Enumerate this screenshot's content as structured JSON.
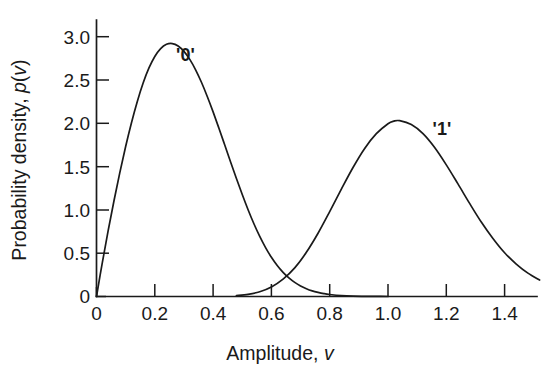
{
  "chart_data": {
    "type": "line",
    "title": "",
    "xlabel": "Amplitude, v",
    "xlabel_prefix": "Amplitude, ",
    "xlabel_symbol": "v",
    "ylabel": "Probability density, p(v)",
    "ylabel_prefix": "Probability density, ",
    "ylabel_symbol": "p",
    "ylabel_arg_open": "(",
    "ylabel_arg": "v",
    "ylabel_arg_close": ")",
    "xlim": [
      0,
      1.52
    ],
    "ylim": [
      0,
      3.25
    ],
    "grid": false,
    "legend_position": "inline-annotations",
    "xticks": [
      0,
      0.2,
      0.4,
      0.6,
      0.8,
      1.0,
      1.2,
      1.4
    ],
    "xticklabels": [
      "0",
      "0.2",
      "0.4",
      "0.6",
      "0.8",
      "1.0",
      "1.2",
      "1.4"
    ],
    "yticks": [
      0,
      0.5,
      1.0,
      1.5,
      2.0,
      2.5,
      3.0
    ],
    "yticklabels": [
      "0",
      "0.5",
      "1.0",
      "1.5",
      "2.0",
      "2.5",
      "3.0"
    ],
    "line_color": "#1a1a1a",
    "series": [
      {
        "name": "'0'",
        "label": "'0'",
        "label_x": 0.305,
        "label_y": 2.72,
        "peak": {
          "x": 0.21,
          "y": 3.03
        },
        "x": [
          0.0,
          0.02,
          0.04,
          0.06,
          0.08,
          0.1,
          0.12,
          0.14,
          0.16,
          0.18,
          0.2,
          0.22,
          0.24,
          0.26,
          0.28,
          0.3,
          0.32,
          0.34,
          0.36,
          0.38,
          0.4,
          0.42,
          0.44,
          0.46,
          0.48,
          0.5,
          0.52,
          0.54,
          0.56,
          0.58,
          0.6,
          0.62,
          0.64,
          0.66,
          0.68,
          0.7,
          0.72,
          0.74,
          0.76,
          0.78,
          0.8,
          0.84,
          0.88,
          0.92,
          0.96,
          1.0
        ],
        "y": [
          0.0,
          0.392,
          0.76,
          1.106,
          1.43,
          1.732,
          2.007,
          2.253,
          2.465,
          2.639,
          2.772,
          2.863,
          2.912,
          2.921,
          2.893,
          2.831,
          2.738,
          2.618,
          2.474,
          2.31,
          2.132,
          1.943,
          1.749,
          1.554,
          1.362,
          1.177,
          1.002,
          0.84,
          0.694,
          0.565,
          0.453,
          0.358,
          0.279,
          0.215,
          0.163,
          0.122,
          0.09,
          0.065,
          0.047,
          0.033,
          0.023,
          0.01,
          0.004,
          0.002,
          0.001,
          0.0
        ]
      },
      {
        "name": "'1'",
        "label": "'1'",
        "label_x": 1.185,
        "label_y": 1.86,
        "peak": {
          "x": 1.02,
          "y": 2.03
        },
        "x": [
          0.48,
          0.52,
          0.56,
          0.6,
          0.64,
          0.68,
          0.72,
          0.76,
          0.8,
          0.84,
          0.88,
          0.92,
          0.96,
          1.0,
          1.02,
          1.04,
          1.08,
          1.12,
          1.16,
          1.2,
          1.24,
          1.28,
          1.32,
          1.36,
          1.4,
          1.44,
          1.48,
          1.52
        ],
        "y": [
          0.01,
          0.025,
          0.055,
          0.11,
          0.2,
          0.33,
          0.51,
          0.73,
          0.98,
          1.24,
          1.49,
          1.71,
          1.88,
          1.995,
          2.025,
          2.03,
          1.985,
          1.88,
          1.72,
          1.52,
          1.3,
          1.075,
          0.86,
          0.67,
          0.505,
          0.375,
          0.27,
          0.19
        ]
      }
    ],
    "intersection": {
      "x": 0.6,
      "y": 0.255
    }
  },
  "figure": {
    "background_color": "#ffffff",
    "axis_color": "#1a1a1a"
  }
}
